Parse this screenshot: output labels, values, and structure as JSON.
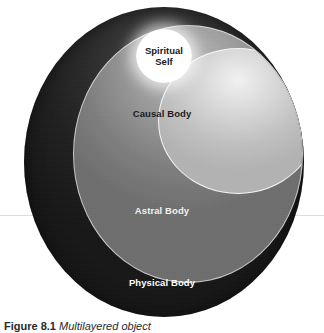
{
  "figure": {
    "caption_label": "Figure 8.1",
    "caption_title": "Multilayered object",
    "background_color": "#ffffff"
  },
  "diagram": {
    "type": "concentric-spheres",
    "layers": [
      {
        "id": "physical-body",
        "label": "Physical Body",
        "order": 1,
        "position": "outermost",
        "fill_color": "#262626",
        "label_color": "#ffffff"
      },
      {
        "id": "astral-body",
        "label": "Astral Body",
        "order": 2,
        "position": "second",
        "fill_color": "#8f8f8f",
        "label_color": "#f2f2f2"
      },
      {
        "id": "causal-body",
        "label": "Causal Body",
        "order": 3,
        "position": "third",
        "fill_color": "#d6d6d6",
        "label_color": "#1c1c1c"
      },
      {
        "id": "spiritual-self",
        "label_line1": "Spiritual",
        "label_line2": "Self",
        "label": "Spiritual Self",
        "order": 4,
        "position": "innermost",
        "fill_color": "#ffffff",
        "label_color": "#1a1a1a"
      }
    ]
  }
}
